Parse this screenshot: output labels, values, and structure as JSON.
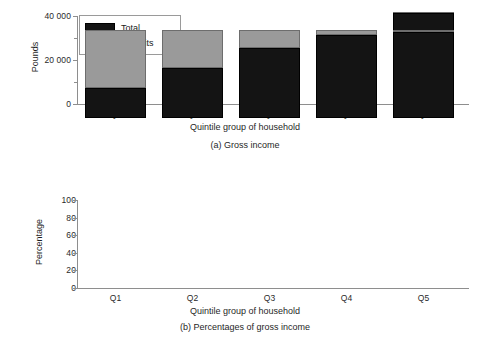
{
  "chart_data": [
    {
      "type": "bar",
      "id": "gross-income",
      "title": "(a) Gross income",
      "xlabel": "Quintile group of household",
      "ylabel": "Pounds",
      "categories": [
        "Q1",
        "Q2",
        "Q3",
        "Q4",
        "Q5"
      ],
      "ylim": [
        0,
        40000
      ],
      "yticks": [
        0,
        20000,
        40000
      ],
      "ytick_labels": [
        "0",
        "20 000",
        "40 000"
      ],
      "yminor_ticks": [
        10000,
        30000
      ],
      "grid": false,
      "legend": [
        "Total",
        "Benefits"
      ],
      "legend_position": "top-left inside",
      "stacked": true,
      "series": [
        {
          "name": "Total",
          "values": [
            3100,
            6500,
            14500,
            22400,
            41200
          ]
        },
        {
          "name": "Benefits",
          "values": [
            4200,
            5000,
            3200,
            1400,
            800
          ]
        }
      ],
      "totals": [
        7300,
        11500,
        17700,
        23800,
        42000
      ]
    },
    {
      "type": "bar",
      "id": "percentages-of-gross-income",
      "title": "(b) Percentages of gross income",
      "xlabel": "Quintile group of household",
      "ylabel": "Percentage",
      "categories": [
        "Q1",
        "Q2",
        "Q3",
        "Q4",
        "Q5"
      ],
      "ylim": [
        0,
        100
      ],
      "yticks": [
        0,
        20,
        40,
        60,
        80,
        100
      ],
      "ytick_labels": [
        "0",
        "20",
        "40",
        "60",
        "80",
        "100"
      ],
      "grid": false,
      "stacked": true,
      "series": [
        {
          "name": "Total",
          "values": [
            34,
            57,
            80,
            94,
            98
          ]
        },
        {
          "name": "Benefits",
          "values": [
            66,
            43,
            20,
            6,
            2
          ]
        }
      ]
    }
  ],
  "legend": {
    "total_label": "Total",
    "benefits_label": "Benefits"
  },
  "colors": {
    "total": "#141414",
    "benefits": "#9a9a9a",
    "axis": "#8e8e8e",
    "background": "#ffffff",
    "text": "#1a1a1a"
  },
  "panel_a": {
    "ylabel": "Pounds",
    "xlabel": "Quintile group of household",
    "caption": "(a) Gross income",
    "ytick_labels": [
      "40 000",
      "20 000",
      "0"
    ],
    "xtick_labels": [
      "Q1",
      "Q2",
      "Q3",
      "Q4",
      "Q5"
    ]
  },
  "panel_b": {
    "ylabel": "Percentage",
    "xlabel": "Quintile group of household",
    "caption": "(b) Percentages of gross income",
    "ytick_labels": [
      "100",
      "80",
      "60",
      "40",
      "20",
      "0"
    ],
    "xtick_labels": [
      "Q1",
      "Q2",
      "Q3",
      "Q4",
      "Q5"
    ]
  }
}
